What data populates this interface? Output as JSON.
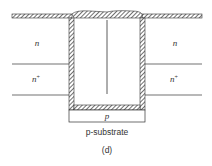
{
  "diagram": {
    "labels": {
      "n_left": "n",
      "n_right": "n",
      "nplus_left": "n",
      "nplus_right": "n",
      "plus": "+",
      "p_region": "p",
      "substrate": "p-substrate",
      "caption": "(d)"
    },
    "colors": {
      "stroke": "#333333",
      "background": "#ffffff"
    }
  }
}
